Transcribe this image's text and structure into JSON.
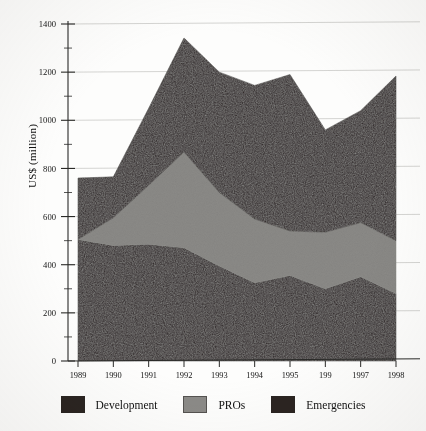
{
  "chart_data": {
    "type": "area",
    "stacked": true,
    "title": "",
    "subtitle": "",
    "xlabel": "",
    "ylabel": "US$ (million)",
    "categories": [
      "1989",
      "1990",
      "1991",
      "1992",
      "1993",
      "1994",
      "1995",
      "199",
      "1997",
      "1998"
    ],
    "x_tick_labels": [
      "1989",
      "1990",
      "1991",
      "1992",
      "1993",
      "1994",
      "1995",
      "199",
      "1997",
      "1998"
    ],
    "y_tick_labels": [
      "0",
      "200",
      "400",
      "600",
      "800",
      "1000",
      "1200",
      "1400"
    ],
    "y_tick_values": [
      0,
      200,
      400,
      600,
      800,
      1000,
      1200,
      1400
    ],
    "y_minor_tick_values": [
      100,
      300,
      500,
      700,
      900,
      1100,
      1300
    ],
    "ylim": [
      0,
      1400
    ],
    "grid": true,
    "grid_orientation": "horizontal",
    "legend_position": "bottom",
    "series": [
      {
        "name": "Development",
        "color": "#2b2421",
        "values": [
          505,
          480,
          485,
          470,
          395,
          325,
          355,
          300,
          350,
          280
        ]
      },
      {
        "name": "PROs",
        "color": "#8b8a87",
        "values": [
          0,
          115,
          245,
          398,
          305,
          265,
          185,
          235,
          225,
          220
        ]
      },
      {
        "name": "Emergencies",
        "color": "#2b2421",
        "values": [
          255,
          170,
          320,
          474,
          500,
          555,
          650,
          425,
          465,
          684
        ]
      }
    ],
    "cumulative_tops": {
      "development": [
        505,
        480,
        485,
        470,
        395,
        325,
        355,
        300,
        350,
        280
      ],
      "pros": [
        505,
        595,
        730,
        868,
        700,
        590,
        540,
        535,
        575,
        500
      ],
      "emergencies": [
        760,
        765,
        1050,
        1342,
        1200,
        1145,
        1190,
        960,
        1040,
        1184
      ]
    }
  },
  "legend": {
    "items": [
      {
        "label": "Development",
        "color": "#2b2421"
      },
      {
        "label": "PROs",
        "color": "#8b8a87"
      },
      {
        "label": "Emergencies",
        "color": "#2b2421"
      }
    ]
  },
  "axis": {
    "y_title": "US$ (million)"
  }
}
